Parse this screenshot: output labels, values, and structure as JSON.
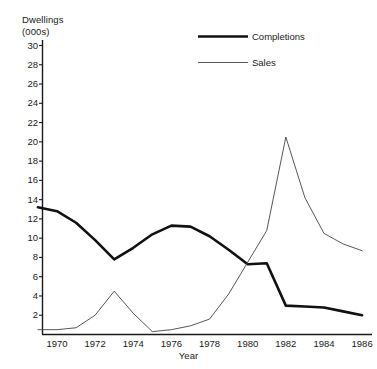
{
  "chart_data": {
    "type": "line",
    "title": "",
    "xlabel": "Year",
    "ylabel": "Dwellings (000s)",
    "ylabel_line1": "Dwellings",
    "ylabel_line2": "(000s)",
    "xlim": [
      1969,
      1986
    ],
    "ylim": [
      0,
      30
    ],
    "ytick_step": 2,
    "xtick_step": 2,
    "grid": false,
    "legend_position": "top-right",
    "yticks": [
      30,
      28,
      26,
      24,
      22,
      20,
      18,
      16,
      14,
      12,
      10,
      8,
      6,
      4,
      2
    ],
    "xticks": [
      1970,
      1972,
      1974,
      1976,
      1978,
      1980,
      1982,
      1984,
      1986
    ],
    "x": [
      1969,
      1970,
      1971,
      1972,
      1973,
      1974,
      1975,
      1976,
      1977,
      1978,
      1979,
      1980,
      1981,
      1982,
      1983,
      1984,
      1985,
      1986
    ],
    "series": [
      {
        "name": "Completions",
        "style": "thick",
        "color": "#111111",
        "width": 2.6,
        "values": [
          13.2,
          12.8,
          11.6,
          9.8,
          7.8,
          9.0,
          10.4,
          11.3,
          11.2,
          10.2,
          8.8,
          7.3,
          7.4,
          3.0,
          2.9,
          2.8,
          2.4,
          2.0
        ]
      },
      {
        "name": "Sales",
        "style": "thin",
        "color": "#444444",
        "width": 0.9,
        "values": [
          0.5,
          0.5,
          0.7,
          2.0,
          4.5,
          2.2,
          0.3,
          0.5,
          0.9,
          1.6,
          4.2,
          7.5,
          10.8,
          20.5,
          14.2,
          10.5,
          9.4,
          8.7
        ]
      }
    ],
    "legend": [
      {
        "label": "Completions",
        "style": "thick"
      },
      {
        "label": "Sales",
        "style": "thin"
      }
    ]
  }
}
